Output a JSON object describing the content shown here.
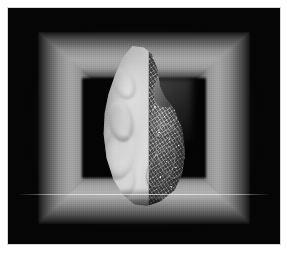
{
  "figure": {
    "title": "Volume-rendered anatomical specimen with split surface/texture rendering",
    "modality": "grayscale volume rendering",
    "caption": ""
  },
  "canvas": {
    "background_color": "#050505",
    "page_margin_color": "#ffffff",
    "width_px": 287,
    "height_px": 260,
    "render_area": {
      "left_px": 8,
      "top_px": 8,
      "width_px": 272,
      "height_px": 236
    }
  },
  "frame": {
    "name": "perspective box frame",
    "description": "Glowing gray trapezoidal walls receding toward a dark inner opening",
    "wall_highlight_color": "#b2b2b2",
    "wall_shadow_color": "#101010",
    "interior_color": "#040404",
    "walls": [
      {
        "id": "wall-top",
        "label": "top wall"
      },
      {
        "id": "wall-bottom",
        "label": "bottom wall"
      },
      {
        "id": "wall-left",
        "label": "left wall"
      },
      {
        "id": "wall-right",
        "label": "right wall"
      }
    ],
    "floor_highlight_color": "#fafafa"
  },
  "specimen": {
    "name": "anatomical organ specimen",
    "shape": "rounded asymmetric organ with superior vessel stump",
    "split_axis": "vertical",
    "halves": [
      {
        "id": "left-half",
        "label": "smooth surface rendering",
        "style": "smooth shaded isosurface",
        "tone": "bright",
        "highlight_color": "#dcdcdc",
        "shadow_color": "#6d6d6d"
      },
      {
        "id": "right-half",
        "label": "textured volume rendering",
        "style": "granular detailed surface with vascular relief",
        "tone": "dark",
        "highlight_color": "#d4d4d4",
        "shadow_color": "#2a2a2a"
      }
    ],
    "cut_plane_color": "#ffffff"
  }
}
